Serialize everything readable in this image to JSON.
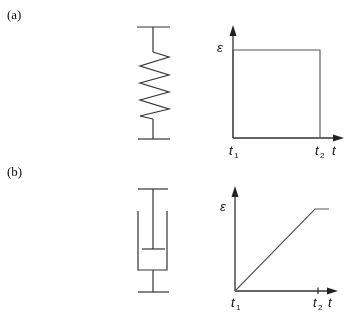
{
  "panels": [
    {
      "label": "(a)",
      "element": "spring",
      "chart": {
        "y_axis_label": "ε",
        "x_axis_label": "t",
        "ticks": [
          {
            "name": "t",
            "sub": "1"
          },
          {
            "name": "t",
            "sub": "2"
          }
        ]
      }
    },
    {
      "label": "(b)",
      "element": "dashpot",
      "chart": {
        "y_axis_label": "ε",
        "x_axis_label": "t",
        "ticks": [
          {
            "name": "t",
            "sub": "1"
          },
          {
            "name": "t",
            "sub": "2"
          }
        ]
      }
    }
  ],
  "chart_data": [
    {
      "type": "line",
      "title": "(a) Spring: strain vs time",
      "xlabel": "t",
      "ylabel": "ε",
      "x_ticks": [
        "t1",
        "t2"
      ],
      "series": [
        {
          "name": "strain",
          "x": [
            "t1",
            "t1",
            "t2",
            "t2"
          ],
          "y": [
            0,
            1,
            1,
            0
          ]
        }
      ],
      "description": "Instantaneous step to constant strain at t1, held until t2, then instantaneous drop to zero"
    },
    {
      "type": "line",
      "title": "(b) Dashpot: strain vs time",
      "xlabel": "t",
      "ylabel": "ε",
      "x_ticks": [
        "t1",
        "t2"
      ],
      "series": [
        {
          "name": "strain",
          "x": [
            "t1",
            "t2",
            "after t2"
          ],
          "y": [
            0,
            1,
            1
          ]
        }
      ],
      "description": "Strain increases linearly from t1 to t2, then remains constant"
    }
  ]
}
